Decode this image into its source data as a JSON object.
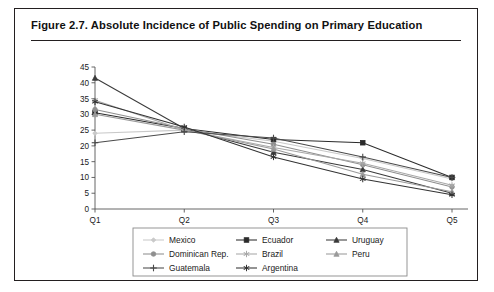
{
  "figure": {
    "title": "Figure 2.7.  Absolute Incidence of Public Spending on Primary Education"
  },
  "chart_data": {
    "type": "line",
    "title": "Figure 2.7.  Absolute Incidence of Public Spending on Primary Education",
    "xlabel": "",
    "ylabel": "",
    "categories": [
      "Q1",
      "Q2",
      "Q3",
      "Q4",
      "Q5"
    ],
    "ylim": [
      0,
      45
    ],
    "ytick_step": 5,
    "yticks": [
      0,
      5,
      10,
      15,
      20,
      25,
      30,
      35,
      40,
      45
    ],
    "grid": false,
    "legend_position": "bottom",
    "legend_columns": 3,
    "series": [
      {
        "name": "Mexico",
        "values": [
          24.0,
          25.0,
          21.5,
          16.0,
          9.5
        ],
        "color": "#c9c9c9",
        "marker": "diamond"
      },
      {
        "name": "Ecuador",
        "values": [
          30.5,
          25.5,
          22.0,
          21.0,
          10.0
        ],
        "color": "#2b2b2b",
        "marker": "square"
      },
      {
        "name": "Uruguay",
        "values": [
          41.5,
          25.5,
          18.0,
          12.5,
          5.0
        ],
        "color": "#3a3a3a",
        "marker": "triangle"
      },
      {
        "name": "Dominican Rep.",
        "values": [
          31.5,
          25.5,
          20.5,
          14.0,
          7.0
        ],
        "color": "#8f8f8f",
        "marker": "circle"
      },
      {
        "name": "Brazil",
        "values": [
          34.5,
          25.0,
          19.5,
          14.5,
          7.5
        ],
        "color": "#a8a8a8",
        "marker": "asterisk"
      },
      {
        "name": "Peru",
        "values": [
          30.0,
          25.0,
          19.0,
          11.0,
          5.5
        ],
        "color": "#9a9a9a",
        "marker": "triangle"
      },
      {
        "name": "Guatemala",
        "values": [
          21.0,
          24.5,
          22.5,
          16.5,
          10.0
        ],
        "color": "#4a4a4a",
        "marker": "plus"
      },
      {
        "name": "Argentina",
        "values": [
          34.0,
          26.0,
          16.5,
          9.5,
          4.5
        ],
        "color": "#333333",
        "marker": "asterisk"
      }
    ]
  },
  "legend": {
    "entries": [
      "Mexico",
      "Ecuador",
      "Uruguay",
      "Dominican Rep.",
      "Brazil",
      "Peru",
      "Guatemala",
      "Argentina"
    ]
  }
}
